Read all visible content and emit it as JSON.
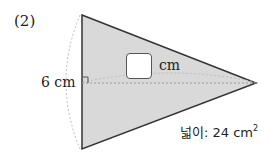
{
  "diagram": {
    "problem_number": "(2)",
    "height_label": "6 cm",
    "answer_unit": "cm",
    "area_prefix": "넓이: 24 cm",
    "area_superscript": "2",
    "shape": {
      "type": "triangle",
      "vertices": {
        "top": [
          82,
          15
        ],
        "bottom": [
          82,
          149
        ],
        "right": [
          256,
          83
        ]
      },
      "fill_color": "#d9d9d9",
      "stroke_color": "#333333"
    },
    "answer_box": {
      "value": ""
    }
  }
}
